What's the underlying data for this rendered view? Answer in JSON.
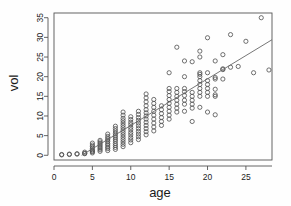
{
  "chart_data": {
    "type": "scatter",
    "title": "",
    "xlabel": "age",
    "ylabel": "vol",
    "xlim": [
      0,
      28.4
    ],
    "ylim": [
      -1.2,
      36.2
    ],
    "xticks": [
      0,
      5,
      10,
      15,
      20,
      25
    ],
    "yticks": [
      0,
      5,
      10,
      15,
      20,
      25,
      30,
      35
    ],
    "grid": false,
    "legend": null,
    "marker": "open-circle",
    "marker_color": "#4d4d4d",
    "frame_color": "#555555",
    "trendline": {
      "type": "linear-fit",
      "x_start": 3.6,
      "y_start": 0.0,
      "x_end": 28.4,
      "y_end": 29.4,
      "color": "#666666"
    },
    "points": [
      [
        1,
        0.1
      ],
      [
        1,
        0.2
      ],
      [
        2,
        0.2
      ],
      [
        2,
        0.3
      ],
      [
        3,
        0.3
      ],
      [
        3,
        0.4
      ],
      [
        4,
        0.4
      ],
      [
        4,
        0.5
      ],
      [
        4,
        0.8
      ],
      [
        5,
        0.6
      ],
      [
        5,
        0.9
      ],
      [
        5,
        1.1
      ],
      [
        5,
        1.4
      ],
      [
        5,
        1.8
      ],
      [
        5,
        2.2
      ],
      [
        5,
        2.6
      ],
      [
        5,
        3.1
      ],
      [
        6,
        1.0
      ],
      [
        6,
        1.4
      ],
      [
        6,
        1.8
      ],
      [
        6,
        2.2
      ],
      [
        6,
        2.6
      ],
      [
        6,
        3.0
      ],
      [
        6,
        3.4
      ],
      [
        6,
        3.8
      ],
      [
        7,
        1.2
      ],
      [
        7,
        1.7
      ],
      [
        7,
        2.1
      ],
      [
        7,
        2.6
      ],
      [
        7,
        3.0
      ],
      [
        7,
        3.5
      ],
      [
        7,
        3.9
      ],
      [
        7,
        4.3
      ],
      [
        7,
        4.8
      ],
      [
        7,
        5.4
      ],
      [
        8,
        1.5
      ],
      [
        8,
        2.0
      ],
      [
        8,
        2.5
      ],
      [
        8,
        3.0
      ],
      [
        8,
        3.6
      ],
      [
        8,
        4.1
      ],
      [
        8,
        4.6
      ],
      [
        8,
        5.1
      ],
      [
        8,
        5.6
      ],
      [
        8,
        6.2
      ],
      [
        8,
        6.8
      ],
      [
        8,
        7.4
      ],
      [
        9,
        2.2
      ],
      [
        9,
        2.8
      ],
      [
        9,
        3.4
      ],
      [
        9,
        4.0
      ],
      [
        9,
        4.6
      ],
      [
        9,
        5.2
      ],
      [
        9,
        5.8
      ],
      [
        9,
        6.4
      ],
      [
        9,
        7.0
      ],
      [
        9,
        7.6
      ],
      [
        9,
        8.2
      ],
      [
        9,
        8.8
      ],
      [
        9,
        9.4
      ],
      [
        9,
        10.2
      ],
      [
        9,
        11.0
      ],
      [
        10,
        3.2
      ],
      [
        10,
        3.9
      ],
      [
        10,
        4.5
      ],
      [
        10,
        5.2
      ],
      [
        10,
        5.8
      ],
      [
        10,
        6.5
      ],
      [
        10,
        7.1
      ],
      [
        10,
        7.8
      ],
      [
        10,
        8.4
      ],
      [
        10,
        9.1
      ],
      [
        10,
        9.8
      ],
      [
        11,
        4.0
      ],
      [
        11,
        4.7
      ],
      [
        11,
        5.4
      ],
      [
        11,
        6.1
      ],
      [
        11,
        6.8
      ],
      [
        11,
        7.5
      ],
      [
        11,
        8.2
      ],
      [
        11,
        8.9
      ],
      [
        11,
        9.6
      ],
      [
        11,
        10.4
      ],
      [
        11,
        11.2
      ],
      [
        12,
        5.2
      ],
      [
        12,
        6.0
      ],
      [
        12,
        6.8
      ],
      [
        12,
        7.6
      ],
      [
        12,
        8.4
      ],
      [
        12,
        9.2
      ],
      [
        12,
        10.0
      ],
      [
        12,
        10.8
      ],
      [
        12,
        11.6
      ],
      [
        12,
        12.6
      ],
      [
        12,
        13.6
      ],
      [
        12,
        14.6
      ],
      [
        12,
        15.6
      ],
      [
        13,
        6.2
      ],
      [
        13,
        7.2
      ],
      [
        13,
        8.2
      ],
      [
        13,
        9.2
      ],
      [
        13,
        10.2
      ],
      [
        13,
        11.2
      ],
      [
        13,
        12.2
      ],
      [
        13,
        13.2
      ],
      [
        13,
        14.2
      ],
      [
        14,
        7.6
      ],
      [
        14,
        8.6
      ],
      [
        14,
        9.6
      ],
      [
        14,
        10.6
      ],
      [
        14,
        11.6
      ],
      [
        14,
        12.6
      ],
      [
        15,
        9.2
      ],
      [
        15,
        10.2
      ],
      [
        15,
        11.2
      ],
      [
        15,
        12.2
      ],
      [
        15,
        13.2
      ],
      [
        15,
        14.2
      ],
      [
        15,
        15.2
      ],
      [
        15,
        16.2
      ],
      [
        15,
        17.0
      ],
      [
        15,
        21.0
      ],
      [
        16,
        11.0
      ],
      [
        16,
        12.0
      ],
      [
        16,
        13.0
      ],
      [
        16,
        14.0
      ],
      [
        16,
        15.0
      ],
      [
        16,
        16.0
      ],
      [
        16,
        17.0
      ],
      [
        16,
        27.5
      ],
      [
        17,
        11.2
      ],
      [
        17,
        13.0
      ],
      [
        17,
        14.0
      ],
      [
        17,
        15.2
      ],
      [
        17,
        16.2
      ],
      [
        17,
        17.0
      ],
      [
        17,
        20.0
      ],
      [
        17,
        24.0
      ],
      [
        18,
        8.6
      ],
      [
        18,
        12.0
      ],
      [
        18,
        13.0
      ],
      [
        18,
        14.0
      ],
      [
        18,
        15.0
      ],
      [
        18,
        16.0
      ],
      [
        18,
        23.8
      ],
      [
        19,
        12.2
      ],
      [
        19,
        15.0
      ],
      [
        19,
        16.0
      ],
      [
        19,
        17.0
      ],
      [
        19,
        18.0
      ],
      [
        19,
        19.0
      ],
      [
        19,
        20.0
      ],
      [
        19,
        20.6
      ],
      [
        19,
        21.0
      ],
      [
        19,
        25.0
      ],
      [
        19,
        26.5
      ],
      [
        20,
        11.0
      ],
      [
        20,
        15.0
      ],
      [
        20,
        16.0
      ],
      [
        20,
        17.0
      ],
      [
        20,
        18.0
      ],
      [
        20,
        19.0
      ],
      [
        20,
        21.0
      ],
      [
        20,
        29.9
      ],
      [
        21,
        10.3
      ],
      [
        21,
        15.0
      ],
      [
        21,
        15.4
      ],
      [
        21,
        16.8
      ],
      [
        21,
        19.4
      ],
      [
        21,
        19.8
      ],
      [
        21,
        24.0
      ],
      [
        22,
        19.4
      ],
      [
        22,
        21.8
      ],
      [
        22,
        22.0
      ],
      [
        22,
        25.6
      ],
      [
        23,
        22.4
      ],
      [
        23,
        30.7
      ],
      [
        24,
        22.6
      ],
      [
        25,
        29.0
      ],
      [
        26,
        21.0
      ],
      [
        27,
        35.0
      ],
      [
        28,
        21.7
      ]
    ]
  }
}
